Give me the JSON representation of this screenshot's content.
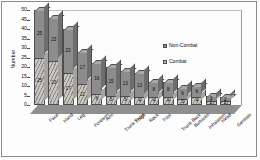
{
  "chart_data": {
    "type": "bar",
    "subtype": "stacked-3d-column",
    "title": "",
    "xlabel": "",
    "ylabel": "Number",
    "ylim": [
      0,
      50
    ],
    "yticks": [
      0,
      5,
      10,
      15,
      20,
      25,
      30,
      35,
      40,
      45,
      50
    ],
    "grid": false,
    "legend_position": "inside-right",
    "categories": [
      "Face",
      "Hand",
      "Leg",
      "Forearm",
      "Arm",
      "Trunk Front",
      "Thigh",
      "Neck",
      "Foot",
      "Trunk Back",
      "Buttocks",
      "Inhalation",
      "Head",
      "Genitals"
    ],
    "series": [
      {
        "name": "Non-Combat",
        "color": "#8c8c8c",
        "values": [
          25,
          23,
          23,
          17,
          16,
          15,
          13,
          13,
          8,
          8,
          6,
          6,
          3,
          2
        ]
      },
      {
        "name": "Combat",
        "color": "#c9c6c1",
        "values": [
          25,
          23,
          17,
          11,
          6,
          5,
          5,
          4,
          4,
          4,
          3,
          4,
          2,
          2
        ]
      }
    ],
    "totals": [
      50,
      46,
      40,
      28,
      22,
      20,
      18,
      17,
      12,
      12,
      9,
      10,
      5,
      4
    ]
  },
  "legend": {
    "entries": [
      {
        "label": "Non-Combat"
      },
      {
        "label": "Combat"
      }
    ]
  },
  "axes": {
    "y_title": "Number"
  }
}
